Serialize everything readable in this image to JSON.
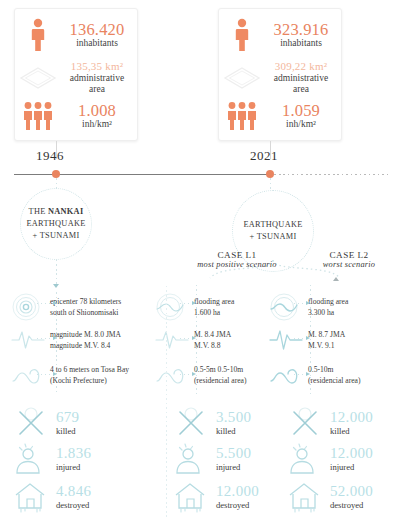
{
  "cards": [
    {
      "id": "1946",
      "rows": [
        {
          "icon": "person-icon",
          "value": "136.420",
          "label": "inhabitants",
          "faded": false
        },
        {
          "icon": "rhombus-area-icon",
          "value": "135,35 km²",
          "label": "administrative area",
          "faded": true
        },
        {
          "icon": "three-people-icon",
          "value": "1.008",
          "label": "inh/km²",
          "faded": false
        }
      ]
    },
    {
      "id": "2021",
      "rows": [
        {
          "icon": "person-icon",
          "value": "323.916",
          "label": "inhabitants",
          "faded": false
        },
        {
          "icon": "rhombus-area-icon",
          "value": "309,22 km²",
          "label": "administrative area",
          "faded": true
        },
        {
          "icon": "three-people-icon",
          "value": "1.059",
          "label": "inh/km²",
          "faded": false
        }
      ]
    }
  ],
  "timeline": {
    "year_left": "1946",
    "year_right": "2021"
  },
  "events": {
    "left": {
      "title_line1_pre": "THE ",
      "title_line1_bold": "NANKAI",
      "title_line2": "EARTHQUAKE",
      "title_line3": "+ TSUNAMI"
    },
    "right": {
      "title_line1": "EARTHQUAKE",
      "title_line2": "+ TSUNAMI"
    }
  },
  "cases": [
    {
      "title": "CASE L1",
      "subtitle": "most positive scenario"
    },
    {
      "title": "CASE L2",
      "subtitle": "worst scenario"
    }
  ],
  "details": {
    "historic": [
      {
        "icon": "epicenter-icon",
        "line1": "epicenter 78 kilometers",
        "line2": "south of Shionomisaki"
      },
      {
        "icon": "seismograph-icon",
        "line1": "magnitude M. 8.0 JMA",
        "line2": "magnitude M.V. 8.4"
      },
      {
        "icon": "wave-icon",
        "line1": "4 to 6 meters on Tosa Bay",
        "line2": "(Kochi Prefecture)"
      }
    ],
    "case_l1": [
      {
        "icon": "epicenter-icon",
        "line1": "flooding area",
        "line2": "1.600 ha"
      },
      {
        "icon": "seismograph-icon",
        "line1": "M. 8.4 JMA",
        "line2": "M.V. 8.8"
      },
      {
        "icon": "wave-icon",
        "line1": "0.5-5m 0.5-10m",
        "line2": "(residencial area)"
      }
    ],
    "case_l2": [
      {
        "icon": "epicenter-icon",
        "line1": "flooding area",
        "line2": "3.300 ha"
      },
      {
        "icon": "seismograph-icon",
        "line1": "M. 8.7 JMA",
        "line2": "M.V. 9.1"
      },
      {
        "icon": "wave-icon",
        "line1": "0.5-10m",
        "line2": "(residencial area)"
      }
    ]
  },
  "casualties": {
    "historic": [
      {
        "icon": "cross-killed-icon",
        "value": "679",
        "label": "killed"
      },
      {
        "icon": "injured-person-icon",
        "value": "1.836",
        "label": "injured"
      },
      {
        "icon": "destroyed-house-icon",
        "value": "4.846",
        "label": "destroyed"
      }
    ],
    "case_l1": [
      {
        "icon": "cross-killed-icon",
        "value": "3.500",
        "label": "killed"
      },
      {
        "icon": "injured-person-icon",
        "value": "5.500",
        "label": "injured"
      },
      {
        "icon": "destroyed-house-icon",
        "value": "12.000",
        "label": "destroyed"
      }
    ],
    "case_l2": [
      {
        "icon": "cross-killed-icon",
        "value": "12.000",
        "label": "killed"
      },
      {
        "icon": "injured-person-icon",
        "value": "12.000",
        "label": "injured"
      },
      {
        "icon": "destroyed-house-icon",
        "value": "52.000",
        "label": "destroyed"
      }
    ]
  },
  "colors": {
    "accent_orange": "#e9845f",
    "accent_orange_light": "#f3b79c",
    "accent_teal": "#b8dfe6",
    "line_gray": "#7c7c7c"
  }
}
